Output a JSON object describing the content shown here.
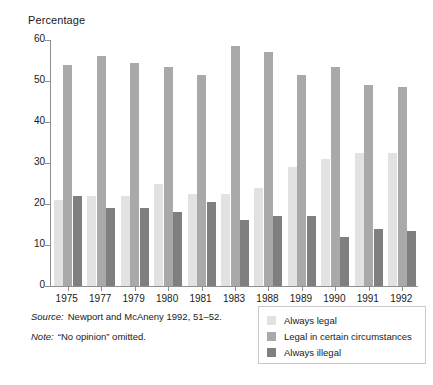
{
  "chart_data": {
    "type": "bar",
    "title": "",
    "subtitle": "",
    "xlabel": "",
    "ylabel": "Percentage",
    "ylim": [
      0,
      60
    ],
    "yticks": [
      0,
      10,
      20,
      30,
      40,
      50,
      60
    ],
    "grid": false,
    "legend_position": "bottom-right",
    "categories": [
      "1975",
      "1977",
      "1979",
      "1980",
      "1981",
      "1983",
      "1988",
      "1989",
      "1990",
      "1991",
      "1992"
    ],
    "series": [
      {
        "name": "Always legal",
        "color": "#e2e2e2",
        "values": [
          21,
          22,
          22,
          25,
          22.5,
          22.5,
          24,
          29,
          31,
          32.5,
          32.5
        ]
      },
      {
        "name": "Legal in certain circumstances",
        "color": "#a9a9a9",
        "values": [
          54,
          56,
          54.5,
          53.5,
          51.5,
          58.5,
          57,
          51.5,
          53.5,
          49,
          48.5
        ]
      },
      {
        "name": "Always illegal",
        "color": "#7f7f7f",
        "values": [
          22,
          19,
          19,
          18,
          20.5,
          16,
          17,
          17,
          12,
          14,
          13.5
        ]
      }
    ],
    "annotations": [
      {
        "label": "Source:",
        "text": "Newport and McAneny 1992, 51–52."
      },
      {
        "label": "Note:",
        "text": "“No opinion” omitted."
      }
    ]
  }
}
